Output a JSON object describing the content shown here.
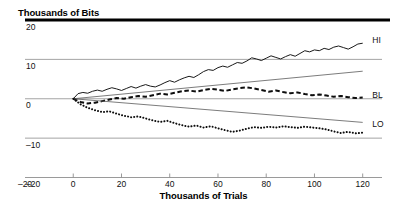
{
  "chart_data": {
    "type": "line",
    "title": "Thousands of Bits",
    "subtitle": "",
    "xlabel": "Thousands of Trials",
    "ylabel": "Thousands of Bits",
    "xlim": [
      -20,
      128
    ],
    "ylim": [
      -20,
      21
    ],
    "xticks": [
      -20,
      0,
      20,
      40,
      60,
      80,
      100,
      120
    ],
    "xticklabels": [
      "–20",
      "0",
      "20",
      "40",
      "60",
      "80",
      "100",
      "120"
    ],
    "yticks": [
      20,
      10,
      0,
      -10,
      -20
    ],
    "yticklabels": [
      "20",
      "10",
      "0",
      "–10",
      "–20"
    ],
    "grid": true,
    "grid_orientation": "horizontal",
    "legend_position": "right-inline",
    "series": [
      {
        "name": "HI",
        "label": "HI",
        "style": "solid",
        "color": "#1a1a1a",
        "width": 1.0,
        "x": [
          0,
          2,
          4,
          6,
          8,
          10,
          12,
          14,
          16,
          18,
          20,
          22,
          24,
          26,
          28,
          30,
          32,
          34,
          36,
          38,
          40,
          42,
          44,
          46,
          48,
          50,
          52,
          54,
          56,
          58,
          60,
          62,
          64,
          66,
          68,
          70,
          72,
          74,
          76,
          78,
          80,
          82,
          84,
          86,
          88,
          90,
          92,
          94,
          96,
          98,
          100,
          102,
          104,
          106,
          108,
          110,
          112,
          114,
          116,
          118,
          120
        ],
        "y": [
          0,
          1.3,
          1.6,
          1.4,
          1.9,
          2.2,
          1.9,
          2.4,
          2.8,
          2.5,
          2.1,
          2.6,
          3.1,
          2.7,
          3.2,
          3.6,
          3.2,
          3.0,
          3.5,
          4.1,
          4.6,
          4.2,
          4.8,
          5.3,
          5.7,
          5.4,
          6.1,
          6.9,
          7.4,
          7.2,
          7.9,
          8.3,
          8.0,
          8.6,
          9.2,
          9.0,
          9.6,
          10.4,
          10.1,
          9.7,
          10.3,
          10.9,
          10.5,
          10.1,
          10.7,
          11.2,
          10.8,
          11.5,
          12.2,
          11.9,
          12.4,
          12.2,
          12.8,
          12.5,
          13.1,
          13.4,
          13.0,
          12.6,
          13.2,
          13.9,
          14.1
        ]
      },
      {
        "name": "upper-envelope",
        "label": "",
        "style": "solid",
        "color": "#5a5a5a",
        "width": 0.8,
        "x": [
          0,
          120
        ],
        "y": [
          0,
          7.0
        ]
      },
      {
        "name": "BL",
        "label": "BL",
        "style": "dashed",
        "color": "#0d0d0d",
        "width": 2.0,
        "x": [
          0,
          3,
          6,
          9,
          12,
          15,
          18,
          21,
          24,
          27,
          30,
          33,
          36,
          39,
          42,
          45,
          48,
          51,
          54,
          57,
          60,
          63,
          66,
          69,
          72,
          75,
          78,
          81,
          84,
          87,
          90,
          93,
          96,
          99,
          102,
          105,
          108,
          111,
          114,
          117,
          120
        ],
        "y": [
          0,
          -0.8,
          -1.2,
          -1.0,
          -0.6,
          -0.2,
          0.2,
          0.0,
          0.4,
          0.7,
          0.5,
          0.9,
          1.3,
          1.1,
          1.5,
          1.9,
          2.1,
          1.8,
          2.2,
          2.5,
          2.3,
          2.0,
          2.4,
          2.7,
          2.9,
          2.6,
          2.2,
          1.8,
          2.1,
          1.7,
          1.4,
          1.6,
          1.2,
          0.9,
          1.1,
          0.8,
          0.5,
          0.7,
          0.4,
          0.2,
          0.3
        ]
      },
      {
        "name": "lower-envelope",
        "label": "",
        "style": "solid",
        "color": "#5a5a5a",
        "width": 0.8,
        "x": [
          0,
          120
        ],
        "y": [
          0,
          -6.0
        ]
      },
      {
        "name": "LO",
        "label": "LO",
        "style": "dotted",
        "color": "#0d0d0d",
        "width": 2.0,
        "x": [
          0,
          3,
          6,
          9,
          12,
          15,
          18,
          21,
          24,
          27,
          30,
          33,
          36,
          39,
          42,
          45,
          48,
          51,
          54,
          57,
          60,
          63,
          66,
          69,
          72,
          75,
          78,
          81,
          84,
          87,
          90,
          93,
          96,
          99,
          102,
          105,
          108,
          111,
          114,
          117,
          120
        ],
        "y": [
          0,
          -1.4,
          -2.3,
          -2.9,
          -3.4,
          -3.2,
          -3.8,
          -4.3,
          -4.7,
          -4.5,
          -5.0,
          -5.5,
          -5.9,
          -5.6,
          -6.2,
          -6.7,
          -7.1,
          -6.8,
          -7.3,
          -7.0,
          -7.5,
          -8.0,
          -8.4,
          -8.1,
          -7.6,
          -7.2,
          -7.4,
          -7.1,
          -7.3,
          -7.0,
          -7.2,
          -7.4,
          -7.1,
          -7.3,
          -7.5,
          -7.8,
          -8.3,
          -8.7,
          -8.4,
          -8.8,
          -8.6
        ]
      }
    ],
    "annotations": [
      {
        "text": "HI",
        "x": 124,
        "y": 15.0
      },
      {
        "text": "BL",
        "x": 124,
        "y": 1.0
      },
      {
        "text": "LO",
        "x": 124,
        "y": -6.5
      }
    ]
  }
}
